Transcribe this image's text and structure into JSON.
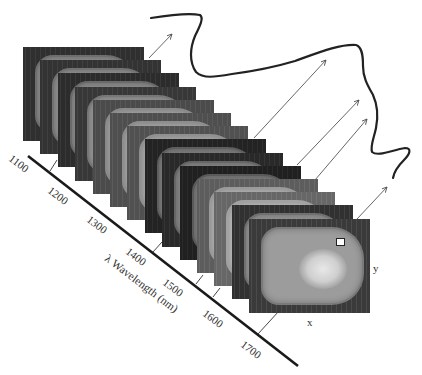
{
  "figure": {
    "type": "hyperspectral image cube diagram",
    "axis": {
      "title": "λ Wavelength (nm)",
      "ticks": [
        "1100",
        "1200",
        "1300",
        "1400",
        "1500",
        "1600",
        "1700"
      ]
    },
    "spatial_labels": {
      "x": "x",
      "y": "y"
    },
    "slice_count": 14,
    "slice_tones": [
      "#6e6e6e",
      "#727272",
      "#6a6a6a",
      "#777777",
      "#8a8a8a",
      "#8e8e8e",
      "#909090",
      "#5e5e5e",
      "#666666",
      "#5a5a5a",
      "#9a9a9a",
      "#a2a2a2",
      "#707070",
      "#7a7a7a"
    ],
    "inner_tones": [
      "#8a8a8a",
      "#8e8e8e",
      "#8a8a8a",
      "#949494",
      "#a0a0a0",
      "#a4a4a4",
      "#a6a6a6",
      "#7c7c7c",
      "#848484",
      "#7a7a7a",
      "#b0b0b0",
      "#b6b6b6",
      "#929292",
      "#9c9c9c"
    ],
    "curve_label": "spectrum",
    "colors": {
      "axis": "#1a1a1a",
      "arrow": "#555555",
      "curve": "#222222"
    }
  }
}
